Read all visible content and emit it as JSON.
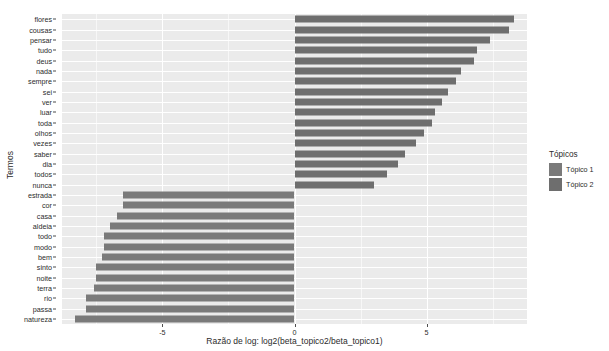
{
  "chart_data": {
    "type": "bar",
    "orientation": "horizontal",
    "title": "",
    "xlabel": "Razão de log: log2(beta_topico2/beta_topico1)",
    "ylabel": "Termos",
    "xlim": [
      -8.8,
      8.8
    ],
    "xticks": [
      -5,
      0,
      5
    ],
    "xticklabels": [
      "-5",
      "0",
      "5"
    ],
    "grid": true,
    "legend": {
      "title": "Tópicos",
      "position": "right",
      "entries": [
        {
          "label": "Tópico 1",
          "color": "#7a7a7a"
        },
        {
          "label": "Tópico 2",
          "color": "#6e6e6e"
        }
      ]
    },
    "categories": [
      "flores",
      "cousas",
      "pensar",
      "tudo",
      "deus",
      "nada",
      "sempre",
      "sei",
      "ver",
      "luar",
      "toda",
      "olhos",
      "vezes",
      "saber",
      "dia",
      "todos",
      "nunca",
      "estrada",
      "cor",
      "casa",
      "aldeia",
      "todo",
      "modo",
      "bem",
      "sinto",
      "noite",
      "terra",
      "rio",
      "passa",
      "natureza"
    ],
    "values": [
      8.3,
      8.1,
      7.4,
      6.9,
      6.8,
      6.3,
      6.1,
      5.8,
      5.6,
      5.3,
      5.2,
      4.9,
      4.6,
      4.2,
      3.9,
      3.5,
      3.0,
      -6.5,
      -6.5,
      -6.7,
      -7.0,
      -7.2,
      -7.2,
      -7.3,
      -7.5,
      -7.5,
      -7.6,
      -7.9,
      -7.9,
      -8.3
    ],
    "series": [
      {
        "name": "Tópico 2",
        "color": "#6e6e6e",
        "note": "positive log-ratio bars (terms more likely in topic 2)"
      },
      {
        "name": "Tópico 1",
        "color": "#7a7a7a",
        "note": "negative log-ratio bars (terms more likely in topic 1)"
      }
    ],
    "panel_background": "#ebebeb",
    "gridline_color": "#ffffff"
  }
}
